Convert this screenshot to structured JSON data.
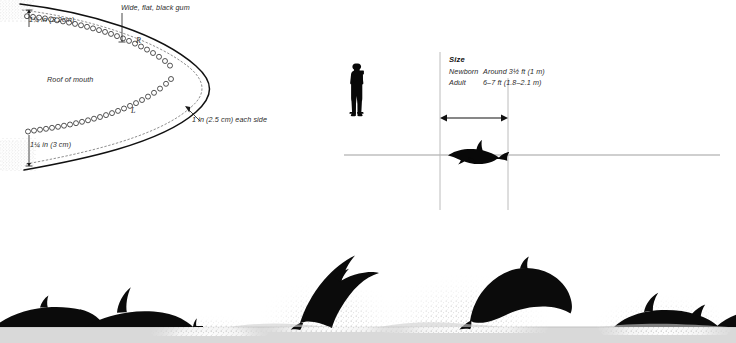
{
  "figure": {
    "domain_kind": "natural-image",
    "background_color": "#ffffff",
    "ink_color": "#000000",
    "rule_color": "#a9a9a9"
  },
  "mouth_diagram": {
    "title_note": "Cutaway of bottlenose dolphin upper jaw / roof of mouth with tooth sockets",
    "labels": {
      "upper_gap": "1¼ in (3.2cm)",
      "lower_gap": "1¼ in (3 cm)",
      "gum": "Wide, flat, black gum",
      "roof": "Roof of mouth",
      "each_side": "1 in (2.5 cm) each side",
      "right_row": "R",
      "left_row": "L"
    },
    "teeth": {
      "upper_row_count": 23,
      "lower_row_count": 23,
      "socket_shape": "small-open-circle"
    }
  },
  "size_panel": {
    "heading": "Size",
    "rows": [
      {
        "label": "Newborn",
        "value": "Around 3½ ft (1 m)"
      },
      {
        "label": "Adult",
        "value": "6–7 ft (1.8–2.1 m)"
      }
    ],
    "scale_comparison": {
      "human_figure": "person-with-binoculars-silhouette",
      "animal_figure": "bottlenose-dolphin-side-silhouette",
      "dimension_arrow": "double-headed-horizontal-arrow",
      "baseline": "horizontal-ground-line"
    }
  },
  "seascape": {
    "caption_note": "Bottlenose dolphins breaching and porpoising across the water surface",
    "animals": [
      {
        "id": "dolphin-surfacing-far-left",
        "pose": "surfacing-back-and-fin"
      },
      {
        "id": "dolphin-porpoising-left",
        "pose": "rolling-dorsal-fin-up"
      },
      {
        "id": "dolphin-small-fin-center-left",
        "pose": "tip-of-fin-above-water"
      },
      {
        "id": "dolphin-leaping-center-left",
        "pose": "full-leap-head-down-splash"
      },
      {
        "id": "dolphin-leaping-center-right",
        "pose": "full-leap-arching-splash"
      },
      {
        "id": "dolphin-reentering-right",
        "pose": "re-entering-water-tail-up"
      }
    ],
    "water_line": "#d4d4d4",
    "spray": "stippled-grey-spray"
  }
}
